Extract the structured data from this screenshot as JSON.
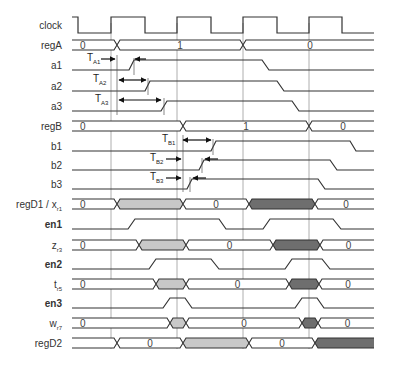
{
  "diagram": {
    "title": "",
    "type": "timing-diagram",
    "colors": {
      "line": "#333333",
      "grid": "#9a9a9a",
      "light_fill": "#c8c8c8",
      "dark_fill": "#6e6e6e"
    },
    "gridlines_x": [
      111,
      177,
      243,
      309
    ],
    "x_start": 72,
    "x_end": 374,
    "signals": [
      {
        "name": "clock",
        "label": "clock",
        "sub": "",
        "bold": false,
        "kind": "clock",
        "y": 25,
        "edges": [
          [
            72,
            1
          ],
          [
            78,
            0
          ],
          [
            111,
            1
          ],
          [
            145,
            0
          ],
          [
            177,
            1
          ],
          [
            211,
            0
          ],
          [
            243,
            1
          ],
          [
            277,
            0
          ],
          [
            309,
            1
          ],
          [
            342,
            0
          ]
        ]
      },
      {
        "name": "regA",
        "label": "regA",
        "sub": "",
        "bold": false,
        "kind": "bus",
        "y": 45,
        "segments": [
          {
            "x1": 72,
            "x2": 114,
            "text": "0",
            "fill": "none"
          },
          {
            "x1": 120,
            "x2": 240,
            "text": "1",
            "fill": "none"
          },
          {
            "x1": 246,
            "x2": 374,
            "text": "0",
            "fill": "none"
          }
        ]
      },
      {
        "name": "a1",
        "label": "a1",
        "sub": "",
        "bold": false,
        "kind": "bit",
        "y": 65,
        "points": [
          [
            72,
            0
          ],
          [
            129,
            0
          ],
          [
            134,
            1
          ],
          [
            262,
            1
          ],
          [
            269,
            0
          ],
          [
            374,
            0
          ]
        ]
      },
      {
        "name": "a2",
        "label": "a2",
        "sub": "",
        "bold": false,
        "kind": "bit",
        "y": 86,
        "points": [
          [
            72,
            0
          ],
          [
            145,
            0
          ],
          [
            150,
            1
          ],
          [
            277,
            1
          ],
          [
            284,
            0
          ],
          [
            374,
            0
          ]
        ]
      },
      {
        "name": "a3",
        "label": "a3",
        "sub": "",
        "bold": false,
        "kind": "bit",
        "y": 106,
        "points": [
          [
            72,
            0
          ],
          [
            161,
            0
          ],
          [
            167,
            1
          ],
          [
            292,
            1
          ],
          [
            299,
            0
          ],
          [
            374,
            0
          ]
        ]
      },
      {
        "name": "regB",
        "label": "regB",
        "sub": "",
        "bold": false,
        "kind": "bus",
        "y": 126,
        "segments": [
          {
            "x1": 72,
            "x2": 180,
            "text": "0",
            "fill": "none"
          },
          {
            "x1": 186,
            "x2": 306,
            "text": "1",
            "fill": "none"
          },
          {
            "x1": 312,
            "x2": 374,
            "text": "0",
            "fill": "none"
          }
        ]
      },
      {
        "name": "b1",
        "label": "b1",
        "sub": "",
        "bold": false,
        "kind": "bit",
        "y": 146,
        "points": [
          [
            72,
            0
          ],
          [
            211,
            0
          ],
          [
            216,
            1
          ],
          [
            350,
            1
          ],
          [
            356,
            0
          ],
          [
            374,
            0
          ]
        ]
      },
      {
        "name": "b2",
        "label": "b2",
        "sub": "",
        "bold": false,
        "kind": "bit",
        "y": 165,
        "points": [
          [
            72,
            0
          ],
          [
            199,
            0
          ],
          [
            204,
            1
          ],
          [
            330,
            1
          ],
          [
            337,
            0
          ],
          [
            374,
            0
          ]
        ]
      },
      {
        "name": "b3",
        "label": "b3",
        "sub": "",
        "bold": false,
        "kind": "bit",
        "y": 184,
        "points": [
          [
            72,
            0
          ],
          [
            187,
            0
          ],
          [
            192,
            1
          ],
          [
            318,
            1
          ],
          [
            325,
            0
          ],
          [
            374,
            0
          ]
        ]
      },
      {
        "name": "regD1",
        "label": "regD1 / x",
        "sub": "r1",
        "bold": false,
        "kind": "bus",
        "y": 204,
        "segments": [
          {
            "x1": 72,
            "x2": 114,
            "text": "0",
            "fill": "none"
          },
          {
            "x1": 120,
            "x2": 180,
            "text": "",
            "fill": "light"
          },
          {
            "x1": 186,
            "x2": 246,
            "text": "0",
            "fill": "none"
          },
          {
            "x1": 252,
            "x2": 312,
            "text": "",
            "fill": "dark"
          },
          {
            "x1": 318,
            "x2": 374,
            "text": "0",
            "fill": "none"
          }
        ]
      },
      {
        "name": "en1",
        "label": "en1",
        "sub": "",
        "bold": true,
        "kind": "bit",
        "y": 224,
        "points": [
          [
            72,
            0
          ],
          [
            128,
            0
          ],
          [
            135,
            1
          ],
          [
            219,
            1
          ],
          [
            226,
            0
          ],
          [
            263,
            0
          ],
          [
            270,
            1
          ],
          [
            333,
            1
          ],
          [
            341,
            0
          ],
          [
            374,
            0
          ]
        ]
      },
      {
        "name": "z",
        "label": "z",
        "sub": "r3",
        "bold": false,
        "kind": "bus",
        "y": 245,
        "segments": [
          {
            "x1": 72,
            "x2": 136,
            "text": "0",
            "fill": "none"
          },
          {
            "x1": 142,
            "x2": 183,
            "text": "",
            "fill": "light"
          },
          {
            "x1": 189,
            "x2": 270,
            "text": "0",
            "fill": "none"
          },
          {
            "x1": 276,
            "x2": 317,
            "text": "",
            "fill": "dark"
          },
          {
            "x1": 323,
            "x2": 374,
            "text": "0",
            "fill": "none"
          }
        ]
      },
      {
        "name": "en2",
        "label": "en2",
        "sub": "",
        "bold": true,
        "kind": "bit",
        "y": 264,
        "points": [
          [
            72,
            0
          ],
          [
            149,
            0
          ],
          [
            156,
            1
          ],
          [
            211,
            1
          ],
          [
            219,
            0
          ],
          [
            285,
            0
          ],
          [
            292,
            1
          ],
          [
            322,
            1
          ],
          [
            330,
            0
          ],
          [
            374,
            0
          ]
        ]
      },
      {
        "name": "t",
        "label": "t",
        "sub": "r5",
        "bold": false,
        "kind": "bus",
        "y": 284,
        "segments": [
          {
            "x1": 72,
            "x2": 153,
            "text": "0",
            "fill": "none"
          },
          {
            "x1": 159,
            "x2": 183,
            "text": "",
            "fill": "light"
          },
          {
            "x1": 189,
            "x2": 286,
            "text": "0",
            "fill": "none"
          },
          {
            "x1": 292,
            "x2": 316,
            "text": "",
            "fill": "dark"
          },
          {
            "x1": 322,
            "x2": 374,
            "text": "0",
            "fill": "none"
          }
        ]
      },
      {
        "name": "en3",
        "label": "en3",
        "sub": "",
        "bold": true,
        "kind": "bit",
        "y": 303,
        "points": [
          [
            72,
            0
          ],
          [
            163,
            0
          ],
          [
            170,
            1
          ],
          [
            185,
            1
          ],
          [
            192,
            0
          ],
          [
            295,
            0
          ],
          [
            302,
            1
          ],
          [
            317,
            1
          ],
          [
            324,
            0
          ],
          [
            374,
            0
          ]
        ]
      },
      {
        "name": "w",
        "label": "w",
        "sub": "r7",
        "bold": false,
        "kind": "bus",
        "y": 323,
        "segments": [
          {
            "x1": 72,
            "x2": 167,
            "text": "0",
            "fill": "none"
          },
          {
            "x1": 173,
            "x2": 183,
            "text": "",
            "fill": "light"
          },
          {
            "x1": 189,
            "x2": 299,
            "text": "0",
            "fill": "none"
          },
          {
            "x1": 305,
            "x2": 315,
            "text": "",
            "fill": "dark"
          },
          {
            "x1": 321,
            "x2": 374,
            "text": "0",
            "fill": "none"
          }
        ]
      },
      {
        "name": "regD2",
        "label": "regD2",
        "sub": "",
        "bold": false,
        "kind": "bus",
        "y": 343,
        "segments": [
          {
            "x1": 72,
            "x2": 114,
            "text": "",
            "fill": "none"
          },
          {
            "x1": 120,
            "x2": 180,
            "text": "0",
            "fill": "none"
          },
          {
            "x1": 186,
            "x2": 246,
            "text": "",
            "fill": "light"
          },
          {
            "x1": 252,
            "x2": 312,
            "text": "0",
            "fill": "none"
          },
          {
            "x1": 318,
            "x2": 374,
            "text": "",
            "fill": "dark"
          }
        ]
      }
    ],
    "timing_annotations": [
      {
        "label": "T",
        "sub": "A1",
        "y": 65,
        "label_x": 87,
        "arrow_in_from": 101,
        "arrow_in_to": 115,
        "arrow_back_from": 146,
        "arrow_back_to": 135,
        "kind": "inward"
      },
      {
        "label": "T",
        "sub": "A2",
        "y": 86,
        "label_x": 93,
        "x1": 118,
        "x2": 147,
        "kind": "double"
      },
      {
        "label": "T",
        "sub": "A3",
        "y": 106,
        "label_x": 95,
        "x1": 118,
        "x2": 162,
        "kind": "double"
      },
      {
        "label": "T",
        "sub": "B1",
        "y": 146,
        "label_x": 162,
        "x1": 182,
        "x2": 212,
        "kind": "double"
      },
      {
        "label": "T",
        "sub": "B2",
        "y": 165,
        "label_x": 150,
        "arrow_in_from": 166,
        "arrow_in_to": 181,
        "arrow_back_from": 218,
        "arrow_back_to": 205,
        "kind": "inward"
      },
      {
        "label": "T",
        "sub": "B3",
        "y": 184,
        "label_x": 150,
        "arrow_in_from": 166,
        "arrow_in_to": 181,
        "arrow_back_from": 206,
        "arrow_back_to": 193,
        "kind": "inward"
      }
    ],
    "marker_lines": [
      {
        "x": 117,
        "y1": 55,
        "y2": 115
      },
      {
        "x": 134,
        "y1": 58,
        "y2": 75
      },
      {
        "x": 148,
        "y1": 78,
        "y2": 95
      },
      {
        "x": 164,
        "y1": 98,
        "y2": 115
      },
      {
        "x": 183,
        "y1": 135,
        "y2": 192
      },
      {
        "x": 213,
        "y1": 139,
        "y2": 155
      },
      {
        "x": 202,
        "y1": 158,
        "y2": 173
      },
      {
        "x": 190,
        "y1": 177,
        "y2": 192
      }
    ]
  }
}
